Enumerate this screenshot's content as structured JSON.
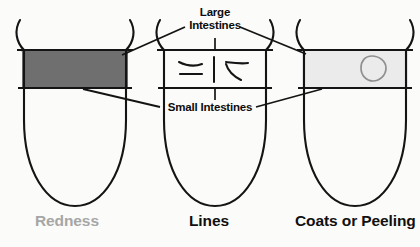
{
  "figure": {
    "background_color": "#fbfbf9",
    "ink_color": "#121212"
  },
  "annotations": {
    "large_intestines": {
      "line1": "Large",
      "line2": "Intestines"
    },
    "small_intestines": {
      "label": "Small Intestines"
    }
  },
  "tongues": [
    {
      "id": "tongue-redness",
      "caption": "Redness",
      "caption_color": "#a6a6a6",
      "band_fill": "#6f6f6f",
      "marking": "solid-dark-band"
    },
    {
      "id": "tongue-lines",
      "caption": "Lines",
      "caption_color": "#101010",
      "band_fill": "#ffffff",
      "marking": "cracks-and-lines"
    },
    {
      "id": "tongue-coats-or-peeling",
      "caption": "Coats or Peeling",
      "caption_color": "#101010",
      "band_fill": "#ebebeb",
      "marking": "peeling-patch-oval"
    }
  ]
}
